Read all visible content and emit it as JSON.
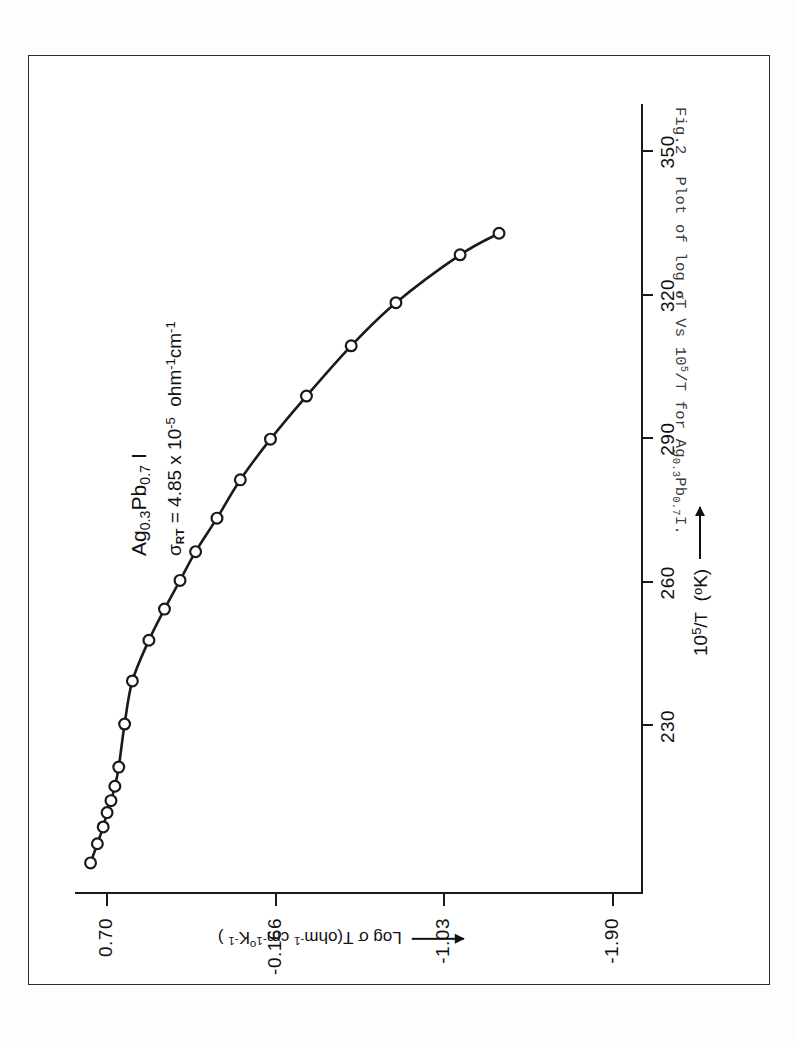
{
  "figure": {
    "number_label": "Fig.2",
    "caption": "Plot of log σT Vs 10⁵/T for Ag₀.₃Pb₀.₇I."
  },
  "annotation": {
    "line1": "Ag₀.₃Pb₀.₇ I",
    "line2": "σRT = 4.85 x 10⁻⁵ ohm⁻¹ cm⁻¹",
    "sigma_symbol": "σ",
    "sigma_subscript": "RT",
    "sigma_value": "4.85 x 10",
    "sigma_exponent": "-5",
    "sigma_units": "ohm",
    "compound_prefix": "Ag",
    "compound_sub1": "0.3",
    "compound_mid": "Pb",
    "compound_sub2": "0.7",
    "compound_suffix": "I"
  },
  "chart_data": {
    "type": "line",
    "title": "",
    "xlabel": "10⁵/T (°K)",
    "ylabel": "Log σ T(ohm⁻¹ cm⁻¹ °K⁻¹)",
    "xlim": [
      195,
      360
    ],
    "ylim": [
      -2.05,
      0.86
    ],
    "xticks": [
      230,
      260,
      290,
      320,
      350
    ],
    "xtick_labels": [
      "230",
      "260",
      "290",
      "320",
      "350"
    ],
    "yticks": [
      0.7,
      -0.166,
      -1.03,
      -1.9
    ],
    "ytick_labels": [
      "0.70",
      "-0.166",
      "-1.03",
      "-1.90"
    ],
    "grid": false,
    "legend": "none",
    "marker": "open-circle",
    "series": [
      {
        "name": "Ag0.3Pb0.7I",
        "x": [
          201.5,
          205.5,
          209.0,
          212.0,
          214.5,
          217.5,
          221.5,
          230.5,
          239.5,
          248.0,
          254.5,
          260.5,
          266.5,
          273.5,
          281.5,
          290.0,
          299.0,
          309.5,
          318.5,
          328.5,
          333.0
        ],
        "y": [
          0.78,
          0.745,
          0.715,
          0.695,
          0.675,
          0.655,
          0.635,
          0.605,
          0.565,
          0.48,
          0.4,
          0.32,
          0.24,
          0.13,
          0.01,
          -0.145,
          -0.33,
          -0.56,
          -0.79,
          -1.12,
          -1.32
        ]
      }
    ]
  },
  "axis_decorations": {
    "x_arrow": "arrow-right",
    "y_arrow": "arrow-left"
  },
  "colors": {
    "ink": "#1a1a1a",
    "paper": "#ffffff",
    "caption": "#3c3c3c"
  }
}
